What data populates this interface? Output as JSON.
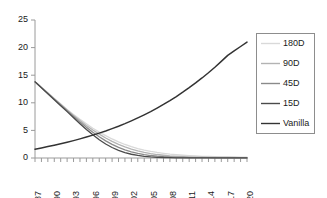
{
  "chart_data": {
    "type": "line",
    "title": "",
    "xlabel": "",
    "ylabel": "",
    "xlim": [
      87,
      120
    ],
    "ylim": [
      0,
      25
    ],
    "yticks": [
      0,
      5,
      10,
      15,
      20,
      25
    ],
    "xticks": [
      87,
      90,
      93,
      96,
      99,
      102,
      105,
      108,
      111,
      114,
      117,
      120
    ],
    "x_minor_tick_step": 1,
    "grid": false,
    "legend_position": "right",
    "x": [
      87,
      88,
      89,
      90,
      91,
      92,
      93,
      94,
      95,
      96,
      97,
      98,
      99,
      100,
      101,
      102,
      103,
      104,
      105,
      106,
      107,
      108,
      109,
      110,
      111,
      112,
      113,
      114,
      115,
      116,
      117,
      118,
      119,
      120
    ],
    "series": [
      {
        "name": "180D",
        "color": "#d9d9d9",
        "values": [
          13.8,
          12.8,
          11.8,
          10.8,
          9.8,
          8.8,
          7.9,
          7.0,
          6.2,
          5.4,
          4.7,
          4.05,
          3.45,
          2.92,
          2.45,
          2.05,
          1.72,
          1.44,
          1.2,
          1.0,
          0.84,
          0.7,
          0.59,
          0.5,
          0.42,
          0.36,
          0.31,
          0.27,
          0.24,
          0.21,
          0.19,
          0.17,
          0.16,
          0.15
        ]
      },
      {
        "name": "90D",
        "color": "#b3b3b3",
        "values": [
          13.8,
          12.78,
          11.76,
          10.74,
          9.72,
          8.7,
          7.72,
          6.78,
          5.9,
          5.08,
          4.32,
          3.62,
          3.0,
          2.46,
          2.0,
          1.6,
          1.28,
          1.02,
          0.8,
          0.63,
          0.5,
          0.39,
          0.31,
          0.25,
          0.2,
          0.16,
          0.14,
          0.12,
          0.11,
          0.1,
          0.09,
          0.09,
          0.08,
          0.08
        ]
      },
      {
        "name": "45D",
        "color": "#8a8a8a",
        "values": [
          13.8,
          12.75,
          11.7,
          10.65,
          9.6,
          8.55,
          7.52,
          6.5,
          5.55,
          4.66,
          3.85,
          3.1,
          2.46,
          1.92,
          1.48,
          1.12,
          0.84,
          0.62,
          0.45,
          0.33,
          0.24,
          0.18,
          0.13,
          0.1,
          0.08,
          0.06,
          0.05,
          0.05,
          0.04,
          0.04,
          0.04,
          0.03,
          0.03,
          0.03
        ]
      },
      {
        "name": "15D",
        "color": "#4a4a4a",
        "values": [
          13.8,
          12.72,
          11.64,
          10.56,
          9.48,
          8.4,
          7.3,
          6.22,
          5.18,
          4.2,
          3.32,
          2.54,
          1.9,
          1.38,
          0.98,
          0.68,
          0.46,
          0.3,
          0.2,
          0.13,
          0.09,
          0.06,
          0.04,
          0.03,
          0.02,
          0.02,
          0.02,
          0.01,
          0.01,
          0.01,
          0.01,
          0.01,
          0.01,
          0.01
        ]
      },
      {
        "name": "Vanilla",
        "color": "#333333",
        "values": [
          1.6,
          1.83,
          2.07,
          2.32,
          2.58,
          2.86,
          3.15,
          3.46,
          3.79,
          4.14,
          4.51,
          4.9,
          5.32,
          5.76,
          6.23,
          6.73,
          7.26,
          7.82,
          8.41,
          9.04,
          9.7,
          10.4,
          11.14,
          11.92,
          12.74,
          13.6,
          14.5,
          15.45,
          16.45,
          17.5,
          18.6,
          19.4,
          20.2,
          21.0
        ]
      }
    ]
  },
  "legend": {
    "entries": [
      {
        "label": "180D"
      },
      {
        "label": "90D"
      },
      {
        "label": "45D"
      },
      {
        "label": "15D"
      },
      {
        "label": "Vanilla"
      }
    ]
  }
}
